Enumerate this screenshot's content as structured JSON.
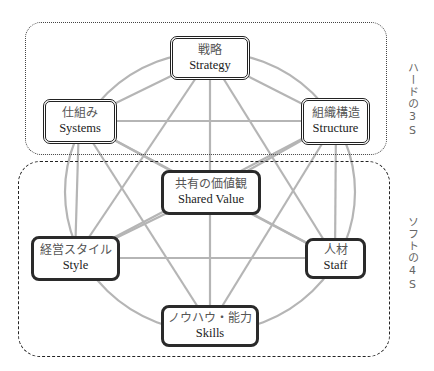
{
  "diagram": {
    "groups": {
      "hard": {
        "label": "ハードの3S"
      },
      "soft": {
        "label": "ソフトの4S"
      }
    },
    "nodes": {
      "strategy": {
        "jp": "戦略",
        "en": "Strategy",
        "group": "hard"
      },
      "systems": {
        "jp": "仕組み",
        "en": "Systems",
        "group": "hard"
      },
      "structure": {
        "jp": "組織構造",
        "en": "Structure",
        "group": "hard"
      },
      "shared_value": {
        "jp": "共有の価値観",
        "en": "Shared Value",
        "group": "soft"
      },
      "style": {
        "jp": "経営スタイル",
        "en": "Style",
        "group": "soft"
      },
      "staff": {
        "jp": "人材",
        "en": "Staff",
        "group": "soft"
      },
      "skills": {
        "jp": "ノウハウ・能力",
        "en": "Skills",
        "group": "soft"
      }
    },
    "colors": {
      "connector": "#b5b5b5",
      "box_border": "#222222",
      "background": "#ffffff"
    }
  }
}
